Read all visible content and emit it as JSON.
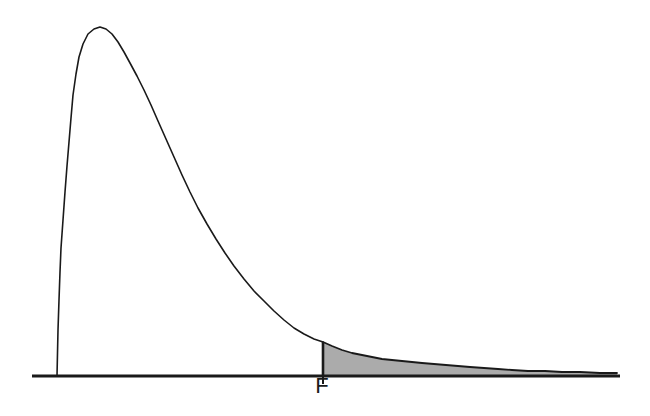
{
  "figure": {
    "background_color": "#ffffff",
    "title": "",
    "subtitle": ""
  },
  "annotations": {
    "critical_value_label": "F",
    "critical_value_label_name": "critical-value-label"
  },
  "colors": {
    "curve_stroke": "#1a1a1a",
    "axis_stroke": "#1a1a1a",
    "tail_fill": "#ababab",
    "tail_stroke": "#1a1a1a",
    "background": "#ffffff"
  },
  "chart_data": {
    "type": "line",
    "title": "",
    "subtitle": "",
    "xlabel": "",
    "ylabel": "",
    "grid": false,
    "legend": null,
    "axes": {
      "x_axis_visible": true,
      "y_axis_visible": false,
      "x_axis_pixel_y": 376,
      "x_axis_pixel_x_start": 32,
      "x_axis_pixel_x_end": 620,
      "xlim": [
        0,
        620
      ],
      "ylim": [
        0,
        376
      ]
    },
    "annotations": [
      {
        "text": "F",
        "type": "x-axis-tick-label",
        "x_pixel": 322,
        "y_pixel": 393,
        "tick_line": {
          "x_pixel": 323,
          "y_top_pixel": 371,
          "y_bottom_pixel": 384
        }
      }
    ],
    "shaded_region": {
      "label": "upper tail (rejection region)",
      "fill": "#ababab",
      "x_start_pixel": 323,
      "x_end_pixel": 617
    },
    "curve_points_pixel": [
      [
        57,
        376
      ],
      [
        58,
        330
      ],
      [
        59,
        300
      ],
      [
        60,
        272
      ],
      [
        61,
        248
      ],
      [
        63,
        220
      ],
      [
        65,
        192
      ],
      [
        67,
        166
      ],
      [
        69,
        142
      ],
      [
        71,
        118
      ],
      [
        73,
        95
      ],
      [
        76,
        74
      ],
      [
        79,
        57
      ],
      [
        83,
        44
      ],
      [
        88,
        34
      ],
      [
        94,
        29
      ],
      [
        100,
        27
      ],
      [
        106,
        29
      ],
      [
        112,
        34
      ],
      [
        118,
        42
      ],
      [
        124,
        52
      ],
      [
        130,
        63
      ],
      [
        137,
        76
      ],
      [
        144,
        90
      ],
      [
        151,
        105
      ],
      [
        158,
        121
      ],
      [
        166,
        139
      ],
      [
        174,
        157
      ],
      [
        182,
        175
      ],
      [
        190,
        192
      ],
      [
        198,
        208
      ],
      [
        207,
        224
      ],
      [
        216,
        239
      ],
      [
        225,
        253
      ],
      [
        234,
        266
      ],
      [
        244,
        279
      ],
      [
        254,
        291
      ],
      [
        264,
        301
      ],
      [
        274,
        311
      ],
      [
        284,
        320
      ],
      [
        294,
        328
      ],
      [
        304,
        334
      ],
      [
        314,
        339
      ],
      [
        323,
        342
      ]
    ],
    "tail_points_pixel": [
      [
        323,
        342
      ],
      [
        332,
        346
      ],
      [
        342,
        350
      ],
      [
        352,
        353
      ],
      [
        362,
        355
      ],
      [
        372,
        357
      ],
      [
        382,
        359
      ],
      [
        392,
        360
      ],
      [
        402,
        361
      ],
      [
        412,
        362
      ],
      [
        422,
        363
      ],
      [
        434,
        364
      ],
      [
        446,
        365
      ],
      [
        458,
        366
      ],
      [
        470,
        367
      ],
      [
        484,
        368
      ],
      [
        498,
        369
      ],
      [
        512,
        370
      ],
      [
        528,
        371
      ],
      [
        545,
        371
      ],
      [
        562,
        372
      ],
      [
        580,
        372
      ],
      [
        600,
        373
      ],
      [
        617,
        373
      ]
    ]
  }
}
